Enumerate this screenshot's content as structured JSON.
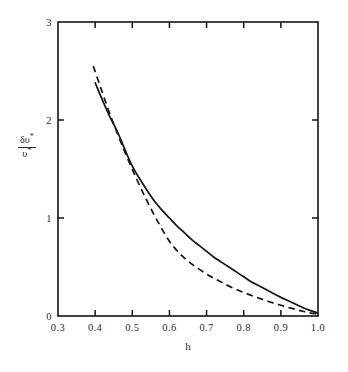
{
  "figure": {
    "background_color": "#ffffff",
    "line_color": "#141414"
  },
  "axes": {
    "x_title": "h",
    "y_title_numerator": "δυ",
    "y_title_numerator_sup": "*",
    "y_title_denominator": "υ",
    "y_title_denominator_sup": "*",
    "x_tick_labels": [
      "0.3",
      "0.4",
      "0.5",
      "0.6",
      "0.7",
      "0.8",
      "0.9",
      "1.0"
    ],
    "y_tick_labels": [
      "0",
      "1",
      "2",
      "3"
    ]
  },
  "chart_data": {
    "type": "line",
    "title": "",
    "xlabel": "h",
    "ylabel": "δυ*/υ*",
    "xlim": [
      0.3,
      1.0
    ],
    "ylim": [
      0,
      3
    ],
    "xticks": [
      0.3,
      0.4,
      0.5,
      0.6,
      0.7,
      0.8,
      0.9,
      1.0
    ],
    "yticks": [
      0,
      1,
      2,
      3
    ],
    "grid": false,
    "legend": null,
    "tick_direction": "in",
    "frame": "full-box",
    "series": [
      {
        "name": "solid-curve",
        "style": "solid",
        "color": "#141414",
        "x": [
          0.4,
          0.42,
          0.44,
          0.46,
          0.48,
          0.5,
          0.52,
          0.54,
          0.56,
          0.58,
          0.6,
          0.62,
          0.64,
          0.66,
          0.68,
          0.7,
          0.72,
          0.74,
          0.76,
          0.78,
          0.8,
          0.82,
          0.84,
          0.86,
          0.88,
          0.9,
          0.92,
          0.94,
          0.96,
          0.98,
          1.0
        ],
        "y": [
          2.38,
          2.2,
          2.03,
          1.88,
          1.7,
          1.53,
          1.4,
          1.28,
          1.17,
          1.08,
          1.0,
          0.92,
          0.85,
          0.78,
          0.72,
          0.66,
          0.6,
          0.55,
          0.5,
          0.45,
          0.4,
          0.35,
          0.31,
          0.27,
          0.23,
          0.19,
          0.155,
          0.12,
          0.085,
          0.055,
          0.03
        ]
      },
      {
        "name": "dashed-curve",
        "style": "dashed",
        "color": "#141414",
        "x": [
          0.395,
          0.415,
          0.435,
          0.455,
          0.475,
          0.495,
          0.515,
          0.535,
          0.555,
          0.575,
          0.595,
          0.615,
          0.635,
          0.655,
          0.675,
          0.695,
          0.715,
          0.735,
          0.755,
          0.775,
          0.795,
          0.815,
          0.835,
          0.855,
          0.875,
          0.895,
          0.915,
          0.935,
          0.955,
          0.975,
          1.0
        ],
        "y": [
          2.55,
          2.33,
          2.11,
          1.91,
          1.72,
          1.54,
          1.37,
          1.21,
          1.06,
          0.92,
          0.79,
          0.69,
          0.61,
          0.545,
          0.49,
          0.44,
          0.395,
          0.355,
          0.315,
          0.28,
          0.248,
          0.218,
          0.19,
          0.163,
          0.138,
          0.115,
          0.093,
          0.072,
          0.052,
          0.034,
          0.02
        ]
      }
    ]
  }
}
